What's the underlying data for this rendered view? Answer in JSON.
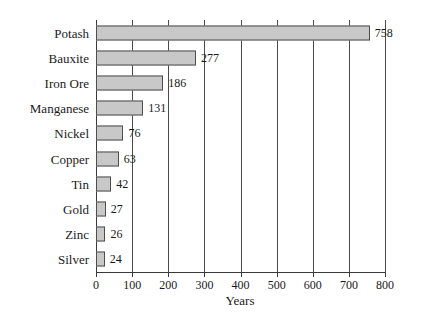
{
  "chart_data": {
    "type": "bar",
    "orientation": "horizontal",
    "title": "",
    "xlabel": "Years",
    "ylabel": "",
    "xlim": [
      0,
      800
    ],
    "xticks": [
      0,
      100,
      200,
      300,
      400,
      500,
      600,
      700,
      800
    ],
    "grid": "vertical",
    "legend": "none",
    "categories": [
      "Potash",
      "Bauxite",
      "Iron Ore",
      "Manganese",
      "Nickel",
      "Copper",
      "Tin",
      "Gold",
      "Zinc",
      "Silver"
    ],
    "values": [
      758,
      277,
      186,
      131,
      76,
      63,
      42,
      27,
      26,
      24
    ],
    "data_labels": [
      "758",
      "277",
      "186",
      "131",
      "76",
      "63",
      "42",
      "27",
      "26",
      "24"
    ],
    "colors": {
      "bar_fill": "#c8c8c8",
      "bar_border": "#4d4d4d",
      "gridline": "#4a4a4a",
      "axis": "#3a3a3a",
      "background": "#ffffff",
      "text": "#1a1a1a"
    }
  }
}
